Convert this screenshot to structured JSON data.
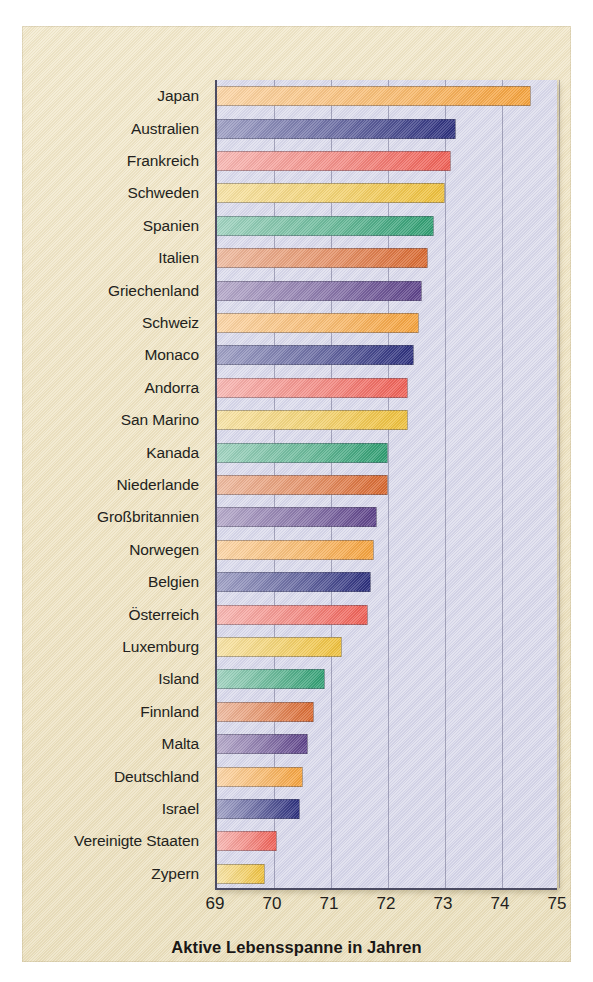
{
  "figure": {
    "background_color": "#efe4c4",
    "plot_background_color": "#d8d8e8",
    "axis_color": "#4c4c63"
  },
  "chart_data": {
    "type": "bar",
    "orientation": "horizontal",
    "title": "",
    "subtitle": "",
    "xlabel": "Aktive Lebensspanne in Jahren",
    "ylabel": "",
    "xlim": [
      69,
      75
    ],
    "ylim": [],
    "xticks": [
      "69",
      "70",
      "71",
      "72",
      "73",
      "74",
      "75"
    ],
    "grid": "vertical",
    "legend": "none",
    "annotations": [],
    "categories": [
      "Japan",
      "Australien",
      "Frankreich",
      "Schweden",
      "Spanien",
      "Italien",
      "Griechenland",
      "Schweiz",
      "Monaco",
      "Andorra",
      "San Marino",
      "Kanada",
      "Niederlande",
      "Großbritannien",
      "Norwegen",
      "Belgien",
      "Österreich",
      "Luxemburg",
      "Island",
      "Finnland",
      "Malta",
      "Deutschland",
      "Israel",
      "Vereinigte Staaten",
      "Zypern"
    ],
    "values": [
      74.5,
      73.2,
      73.1,
      73.0,
      72.8,
      72.7,
      72.6,
      72.55,
      72.45,
      72.35,
      72.35,
      72.0,
      72.0,
      71.8,
      71.75,
      71.7,
      71.65,
      71.2,
      70.9,
      70.7,
      70.6,
      70.5,
      70.45,
      70.05,
      69.85
    ],
    "bar_colors": [
      "#f5a23c",
      "#2c2f7d",
      "#ef5f55",
      "#eec03a",
      "#2f9e72",
      "#d9682f",
      "#5d4289"
    ],
    "bar_color_cycle_length": 7
  },
  "axis_title": "Aktive Lebensspanne in Jahren"
}
